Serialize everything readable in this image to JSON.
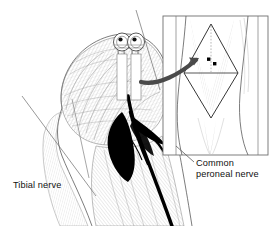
{
  "figure": {
    "type": "anatomical-illustration",
    "background_color": "#ffffff",
    "line_color": "#111111",
    "hatch_color": "#8d8d8d",
    "fill_black": "#000000"
  },
  "labels": {
    "tibial": {
      "text": "Tibial nerve",
      "x": 13,
      "y": 180
    },
    "peroneal": {
      "line1": "Common",
      "line2": "peroneal nerve",
      "text": "Common peroneal nerve",
      "x": 196,
      "y": 158
    }
  },
  "inset": {
    "name": "surface-landmark-inset",
    "x": 163,
    "y": 16,
    "width": 105,
    "height": 139,
    "border_color": "#6f6f6f",
    "description": "Posterior knee surface anatomy showing rhomboid popliteal fossa outline",
    "needle_points": [
      {
        "x": 209,
        "y": 60
      },
      {
        "x": 214,
        "y": 64
      }
    ],
    "needle_point_count": 2
  },
  "arrow": {
    "name": "inset-pointer-arrow",
    "color": "#4a4a4a",
    "from_x": 141,
    "from_y": 82,
    "to_x": 199,
    "to_y": 58
  },
  "structures": {
    "sciatic_trunk": "Sciatic nerve bifurcation",
    "tibial_branch": "Tibial nerve",
    "peroneal_branch": "Common peroneal nerve",
    "fossa_fill": "Popliteal fossa",
    "needles": "Two block needles",
    "needle_count": 2
  },
  "leaders": {
    "tibial": {
      "x1": 89,
      "y1": 178,
      "x2": 72,
      "y2": 99
    },
    "peroneal": {
      "x1": 194,
      "y1": 162,
      "x2": 176,
      "y2": 146
    }
  }
}
